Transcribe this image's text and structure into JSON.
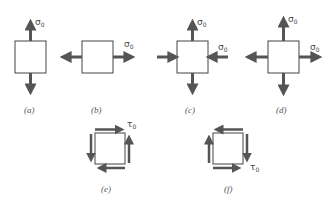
{
  "figure": {
    "panels": [
      {
        "id": "a",
        "label": "(a)",
        "stress": "uniaxial vertical tension",
        "symbol": "σ",
        "subscript": "0"
      },
      {
        "id": "b",
        "label": "(b)",
        "stress": "uniaxial horizontal tension",
        "symbol": "σ",
        "subscript": "0"
      },
      {
        "id": "c",
        "label": "(c)",
        "stress": "vertical tension, horizontal compression",
        "symbol_top": "σ",
        "symbol_right": "σ",
        "subscript": "0"
      },
      {
        "id": "d",
        "label": "(d)",
        "stress": "biaxial tension",
        "symbol_top": "σ",
        "symbol_right": "σ",
        "subscript": "0"
      },
      {
        "id": "e",
        "label": "(e)",
        "stress": "pure shear (counterclockwise)",
        "symbol": "τ",
        "subscript": "0"
      },
      {
        "id": "f",
        "label": "(f)",
        "stress": "pure shear (clockwise)",
        "symbol": "τ",
        "subscript": "0"
      }
    ],
    "colors": {
      "arrow": "#555555",
      "box_stroke": "#444444",
      "label": "#555555"
    }
  }
}
